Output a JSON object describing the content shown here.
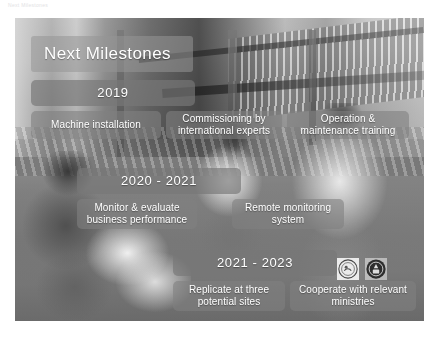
{
  "header": {
    "faint_text": "Next Milestones"
  },
  "slide": {
    "title": "Next Milestones",
    "photo_description": "Grayscale photograph of people working beside a damaged stilt building",
    "timeline": [
      {
        "year": "2019",
        "items": [
          {
            "label": "Machine installation"
          },
          {
            "label": "Commissioning by international experts"
          },
          {
            "label": "Operation & maintenance training"
          }
        ]
      },
      {
        "year": "2020 - 2021",
        "items": [
          {
            "label": "Monitor & evaluate business performance"
          },
          {
            "label": "Remote monitoring system"
          }
        ]
      },
      {
        "year": "2021 - 2023",
        "items": [
          {
            "label": "Replicate at three potential sites"
          },
          {
            "label": "Cooperate with relevant ministries"
          }
        ]
      }
    ],
    "logos": [
      {
        "name": "organisation-emblem-light"
      },
      {
        "name": "organisation-emblem-dark"
      }
    ]
  },
  "caption": {
    "line1": "",
    "line2": ""
  },
  "colors": {
    "overlay_box": "#7e7e7e",
    "text": "#ffffff",
    "page_background": "#ffffff"
  }
}
